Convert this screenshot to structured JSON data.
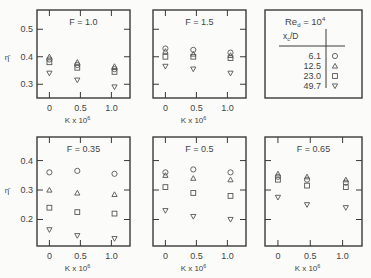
{
  "chart_data": [
    {
      "type": "scatter",
      "title": "F = 1.0",
      "xlabel": "K x 10",
      "xlabel_sup": "6",
      "ylabel": "η̄",
      "xlim": [
        -0.2,
        1.3
      ],
      "ylim": [
        0.25,
        0.57
      ],
      "xticks": [
        0,
        0.5,
        1.0
      ],
      "xtick_labels": [
        "0",
        "0.5",
        "1.0"
      ],
      "yticks": [
        0.3,
        0.4,
        0.5
      ],
      "ytick_labels": [
        "0.3",
        "0.4",
        "0.5"
      ],
      "x": [
        0,
        0.45,
        1.05
      ],
      "series": [
        {
          "name": "6.1",
          "marker": "circle",
          "values": [
            0.39,
            0.37,
            0.355
          ]
        },
        {
          "name": "12.5",
          "marker": "triangle-up",
          "values": [
            0.4,
            0.38,
            0.365
          ]
        },
        {
          "name": "23.0",
          "marker": "square",
          "values": [
            0.38,
            0.36,
            0.345
          ]
        },
        {
          "name": "49.7",
          "marker": "triangle-down",
          "values": [
            0.34,
            0.315,
            0.29
          ]
        }
      ]
    },
    {
      "type": "scatter",
      "title": "F = 1.5",
      "xlabel": "K x 10",
      "xlabel_sup": "6",
      "ylabel": "",
      "xlim": [
        -0.2,
        1.3
      ],
      "ylim": [
        0.25,
        0.57
      ],
      "xticks": [
        0,
        0.5,
        1.0
      ],
      "xtick_labels": [
        "0",
        "0.5",
        "1.0"
      ],
      "yticks": [
        0.3,
        0.4,
        0.5
      ],
      "ytick_labels": [],
      "x": [
        0,
        0.45,
        1.05
      ],
      "series": [
        {
          "name": "6.1",
          "marker": "circle",
          "values": [
            0.43,
            0.425,
            0.415
          ]
        },
        {
          "name": "12.5",
          "marker": "triangle-up",
          "values": [
            0.42,
            0.41,
            0.405
          ]
        },
        {
          "name": "23.0",
          "marker": "square",
          "values": [
            0.4,
            0.4,
            0.395
          ]
        },
        {
          "name": "49.7",
          "marker": "triangle-down",
          "values": [
            0.365,
            0.355,
            0.34
          ]
        }
      ]
    },
    {
      "type": "scatter",
      "title": "F = 0.35",
      "xlabel": "K x 10",
      "xlabel_sup": "6",
      "ylabel": "η̄",
      "xlim": [
        -0.2,
        1.3
      ],
      "ylim": [
        0.11,
        0.48
      ],
      "xticks": [
        0,
        0.5,
        1.0
      ],
      "xtick_labels": [
        "0",
        "0.5",
        "1.0"
      ],
      "yticks": [
        0.2,
        0.3,
        0.4
      ],
      "ytick_labels": [
        "0.2",
        "0.3",
        "0.4"
      ],
      "x": [
        0,
        0.45,
        1.05
      ],
      "series": [
        {
          "name": "6.1",
          "marker": "circle",
          "values": [
            0.36,
            0.365,
            0.355
          ]
        },
        {
          "name": "12.5",
          "marker": "triangle-up",
          "values": [
            0.3,
            0.29,
            0.285
          ]
        },
        {
          "name": "23.0",
          "marker": "square",
          "values": [
            0.24,
            0.225,
            0.22
          ]
        },
        {
          "name": "49.7",
          "marker": "triangle-down",
          "values": [
            0.165,
            0.145,
            0.135
          ]
        }
      ]
    },
    {
      "type": "scatter",
      "title": "F = 0.5",
      "xlabel": "K x 10",
      "xlabel_sup": "6",
      "ylabel": "",
      "xlim": [
        -0.2,
        1.3
      ],
      "ylim": [
        0.11,
        0.48
      ],
      "xticks": [
        0,
        0.5,
        1.0
      ],
      "xtick_labels": [
        "0",
        "0.5",
        "1.0"
      ],
      "yticks": [
        0.2,
        0.3,
        0.4
      ],
      "ytick_labels": [],
      "x": [
        0,
        0.45,
        1.05
      ],
      "series": [
        {
          "name": "6.1",
          "marker": "circle",
          "values": [
            0.36,
            0.37,
            0.36
          ]
        },
        {
          "name": "12.5",
          "marker": "triangle-up",
          "values": [
            0.35,
            0.34,
            0.335
          ]
        },
        {
          "name": "23.0",
          "marker": "square",
          "values": [
            0.31,
            0.29,
            0.28
          ]
        },
        {
          "name": "49.7",
          "marker": "triangle-down",
          "values": [
            0.23,
            0.21,
            0.2
          ]
        }
      ]
    },
    {
      "type": "scatter",
      "title": "F = 0.65",
      "xlabel": "K x 10",
      "xlabel_sup": "6",
      "ylabel": "",
      "xlim": [
        -0.2,
        1.3
      ],
      "ylim": [
        0.11,
        0.48
      ],
      "xticks": [
        0,
        0.5,
        1.0
      ],
      "xtick_labels": [
        "0",
        "0.5",
        "1.0"
      ],
      "yticks": [
        0.2,
        0.3,
        0.4
      ],
      "ytick_labels": [],
      "x": [
        0,
        0.45,
        1.05
      ],
      "series": [
        {
          "name": "6.1",
          "marker": "circle",
          "values": [
            0.345,
            0.335,
            0.325
          ]
        },
        {
          "name": "12.5",
          "marker": "triangle-up",
          "values": [
            0.355,
            0.345,
            0.335
          ]
        },
        {
          "name": "23.0",
          "marker": "square",
          "values": [
            0.335,
            0.315,
            0.31
          ]
        },
        {
          "name": "49.7",
          "marker": "triangle-down",
          "values": [
            0.275,
            0.25,
            0.24
          ]
        }
      ]
    }
  ],
  "legend": {
    "title_main": "Re",
    "title_sub": "d",
    "title_eq": " = 10",
    "title_sup": "4",
    "column_header_main": "x",
    "column_header_sub": "c",
    "column_header_rest": "/D",
    "entries": [
      {
        "label": "6.1",
        "marker": "circle"
      },
      {
        "label": "12.5",
        "marker": "triangle-up"
      },
      {
        "label": "23.0",
        "marker": "square"
      },
      {
        "label": "49.7",
        "marker": "triangle-down"
      }
    ]
  }
}
